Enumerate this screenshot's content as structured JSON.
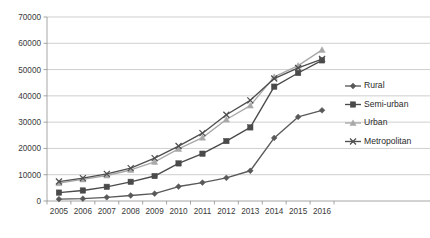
{
  "chart_data": {
    "type": "line",
    "title": "",
    "xlabel": "",
    "ylabel": "",
    "categories": [
      "2005",
      "2006",
      "2007",
      "2008",
      "2009",
      "2010",
      "2011",
      "2012",
      "2013",
      "2014",
      "2015",
      "2016"
    ],
    "ylim": [
      0,
      70000
    ],
    "ytick_values": [
      0,
      10000,
      20000,
      30000,
      40000,
      50000,
      60000,
      70000
    ],
    "ytick_labels": [
      "0",
      "10000",
      "20000",
      "30000",
      "40000",
      "50000",
      "60000",
      "70000"
    ],
    "grid": true,
    "legend_position": "right",
    "series": [
      {
        "name": "Rural",
        "marker": "diamond",
        "color": "#595959",
        "values": [
          700,
          900,
          1400,
          2100,
          2800,
          5500,
          7000,
          8800,
          11500,
          24000,
          32000,
          34500
        ]
      },
      {
        "name": "Semi-urban",
        "marker": "square",
        "color": "#4a4a4a",
        "values": [
          3200,
          4000,
          5400,
          7300,
          9500,
          14300,
          18000,
          22800,
          28000,
          43500,
          48700,
          53500
        ]
      },
      {
        "name": "Urban",
        "marker": "triangle",
        "color": "#a8a8a8",
        "values": [
          6800,
          8200,
          9700,
          11800,
          14900,
          19800,
          24100,
          31000,
          36300,
          47200,
          51500,
          57500
        ]
      },
      {
        "name": "Metropolitan",
        "marker": "cross",
        "color": "#4f4f4f",
        "values": [
          7400,
          8700,
          10300,
          12500,
          16300,
          20900,
          25800,
          32800,
          38300,
          46600,
          50600,
          54000
        ]
      }
    ]
  },
  "legend": {
    "entries": [
      {
        "label": "Rural"
      },
      {
        "label": "Semi-urban"
      },
      {
        "label": "Urban"
      },
      {
        "label": "Metropolitan"
      }
    ]
  }
}
